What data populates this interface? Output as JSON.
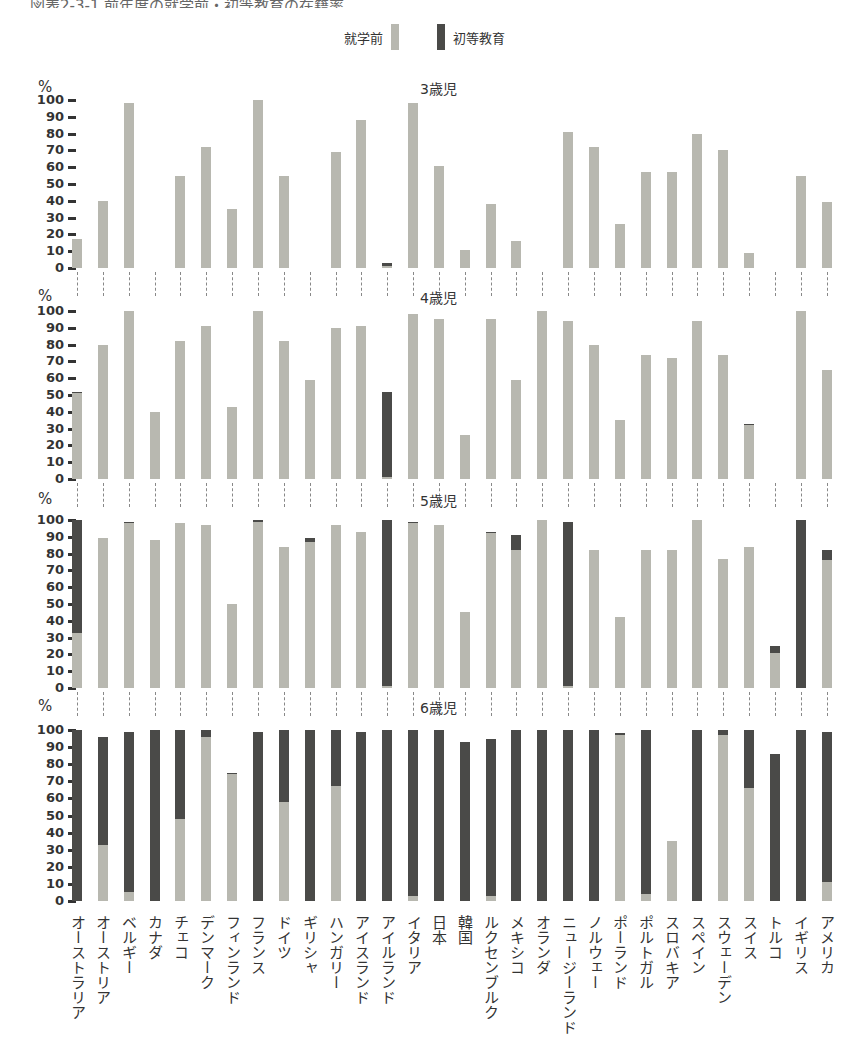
{
  "header": {
    "title": "図表2-3-1 前年度の就学前・初等教育の在籍率"
  },
  "legend": {
    "preschool_label": "就学前",
    "primary_label": "初等教育"
  },
  "colors": {
    "preschool": "#b8b8b0",
    "primary": "#4a4a48"
  },
  "axis": {
    "unit": "%",
    "ticks": [
      "100",
      "90",
      "80",
      "70",
      "60",
      "50",
      "40",
      "30",
      "20",
      "10",
      "0"
    ]
  },
  "chart_data": {
    "type": "bar",
    "stacked": true,
    "ylabel": "%",
    "ylim": [
      0,
      100
    ],
    "legend": [
      "就学前",
      "初等教育"
    ],
    "categories": [
      "オーストラリア",
      "オーストリア",
      "ベルギー",
      "カナダ",
      "チェコ",
      "デンマーク",
      "フィンランド",
      "フランス",
      "ドイツ",
      "ギリシャ",
      "ハンガリー",
      "アイスランド",
      "アイルランド",
      "イタリア",
      "日本",
      "韓国",
      "ルクセンブルク",
      "メキシコ",
      "オランダ",
      "ニュージーランド",
      "ノルウェー",
      "ポーランド",
      "ポルトガル",
      "スロバキア",
      "スペイン",
      "スウェーデン",
      "スイス",
      "トルコ",
      "イギリス",
      "アメリカ"
    ],
    "panels": [
      {
        "title": "3歳児",
        "series": [
          {
            "name": "就学前",
            "values": [
              17,
              40,
              98,
              null,
              55,
              72,
              35,
              100,
              55,
              null,
              69,
              88,
              1,
              98,
              61,
              11,
              38,
              16,
              null,
              81,
              72,
              26,
              57,
              57,
              80,
              70,
              9,
              null,
              55,
              39
            ]
          },
          {
            "name": "初等教育",
            "values": [
              0,
              0,
              0,
              null,
              0,
              0,
              0,
              0,
              0,
              null,
              0,
              0,
              2,
              0,
              0,
              0,
              0,
              0,
              null,
              0,
              0,
              0,
              0,
              0,
              0,
              0,
              0,
              null,
              0,
              0
            ]
          }
        ]
      },
      {
        "title": "4歳児",
        "series": [
          {
            "name": "就学前",
            "values": [
              51,
              80,
              100,
              40,
              82,
              91,
              43,
              100,
              82,
              59,
              90,
              91,
              1,
              98,
              95,
              26,
              95,
              59,
              100,
              94,
              80,
              35,
              74,
              72,
              94,
              74,
              32,
              null,
              100,
              65
            ]
          },
          {
            "name": "初等教育",
            "values": [
              1,
              0,
              0,
              0,
              0,
              0,
              0,
              0,
              0,
              0,
              0,
              0,
              51,
              0,
              0,
              0,
              0,
              0,
              0,
              0,
              0,
              0,
              0,
              0,
              0,
              0,
              1,
              null,
              0,
              0
            ]
          }
        ]
      },
      {
        "title": "5歳児",
        "series": [
          {
            "name": "就学前",
            "values": [
              33,
              89,
              98,
              88,
              98,
              97,
              50,
              99,
              84,
              87,
              97,
              93,
              1,
              98,
              97,
              45,
              92,
              82,
              100,
              1,
              82,
              42,
              82,
              82,
              100,
              77,
              84,
              21,
              0,
              76
            ]
          },
          {
            "name": "初等教育",
            "values": [
              67,
              0,
              1,
              0,
              0,
              0,
              0,
              1,
              0,
              2,
              0,
              0,
              99,
              1,
              0,
              0,
              1,
              9,
              0,
              98,
              0,
              0,
              0,
              0,
              0,
              0,
              0,
              4,
              100,
              6
            ]
          }
        ]
      },
      {
        "title": "6歳児",
        "series": [
          {
            "name": "就学前",
            "values": [
              0,
              33,
              5,
              0,
              48,
              96,
              74,
              0,
              58,
              0,
              67,
              0,
              0,
              3,
              0,
              0,
              3,
              0,
              0,
              0,
              0,
              97,
              4,
              35,
              0,
              97,
              66,
              0,
              0,
              11
            ]
          },
          {
            "name": "初等教育",
            "values": [
              100,
              63,
              94,
              100,
              52,
              4,
              1,
              99,
              42,
              100,
              33,
              99,
              100,
              97,
              100,
              93,
              92,
              100,
              100,
              100,
              100,
              1,
              96,
              0,
              100,
              3,
              34,
              86,
              100,
              88
            ]
          }
        ]
      }
    ]
  }
}
